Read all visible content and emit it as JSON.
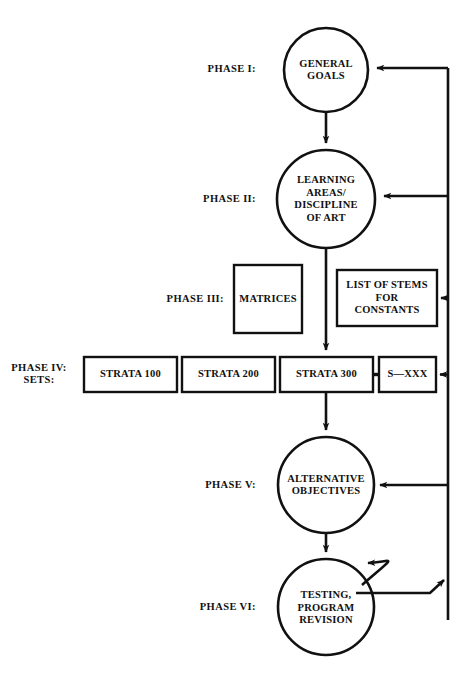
{
  "diagram": {
    "ink_color": "#111111",
    "background_color": "#ffffff",
    "phases": [
      {
        "id": "phase-1",
        "label": "PHASE I:",
        "shape": "circle",
        "text_lines": [
          "GENERAL",
          "GOALS"
        ]
      },
      {
        "id": "phase-2",
        "label": "PHASE II:",
        "shape": "circle",
        "text_lines": [
          "LEARNING",
          "AREAS/",
          "DISCIPLINE",
          "OF ART"
        ]
      },
      {
        "id": "phase-3",
        "label": "PHASE III:",
        "shape": "rectangle",
        "text_lines": [
          "MATRICES"
        ]
      },
      {
        "id": "phase-4",
        "label": "PHASE IV:\nSETS:",
        "shape": "rectangle-row",
        "text_lines": []
      },
      {
        "id": "phase-5",
        "label": "PHASE V:",
        "shape": "circle",
        "text_lines": [
          "ALTERNATIVE",
          "OBJECTIVES"
        ]
      },
      {
        "id": "phase-6",
        "label": "PHASE VI:",
        "shape": "circle",
        "text_lines": [
          "TESTING,",
          "PROGRAM",
          "REVISION"
        ]
      }
    ],
    "nodes": {
      "general_goals": {
        "lines": [
          "GENERAL",
          "GOALS"
        ]
      },
      "learning_areas": {
        "lines": [
          "LEARNING",
          "AREAS/",
          "DISCIPLINE",
          "OF ART"
        ]
      },
      "matrices": {
        "lines": [
          "MATRICES"
        ]
      },
      "list_of_stems": {
        "lines": [
          "LIST OF STEMS",
          "FOR",
          "CONSTANTS"
        ]
      },
      "strata_100": {
        "lines": [
          "STRATA 100"
        ]
      },
      "strata_200": {
        "lines": [
          "STRATA 200"
        ]
      },
      "strata_300": {
        "lines": [
          "STRATA 300"
        ]
      },
      "s_xxx": {
        "lines": [
          "S—XXX"
        ]
      },
      "alternative_objectives": {
        "lines": [
          "ALTERNATIVE",
          "OBJECTIVES"
        ]
      },
      "testing_program_revision": {
        "lines": [
          "TESTING,",
          "PROGRAM",
          "REVISION"
        ]
      }
    },
    "phase_labels": {
      "phase_1": "PHASE I:",
      "phase_2": "PHASE II:",
      "phase_3": "PHASE III:",
      "phase_4": "PHASE IV:\nSETS:",
      "phase_5": "PHASE V:",
      "phase_6": "PHASE VI:"
    },
    "connections": [
      {
        "from": "general_goals",
        "to": "learning_areas",
        "type": "arrow-down"
      },
      {
        "from": "learning_areas",
        "to": "strata_300",
        "type": "arrow-down"
      },
      {
        "from": "strata_300",
        "to": "s_xxx",
        "type": "short-link"
      },
      {
        "from": "strata_300",
        "to": "alternative_objectives",
        "type": "arrow-down"
      },
      {
        "from": "alternative_objectives",
        "to": "testing_program_revision",
        "type": "arrow-down"
      },
      {
        "from": "testing_program_revision",
        "to": "testing_program_revision",
        "type": "self-loop"
      },
      {
        "from": "testing_program_revision",
        "to": "feedback-bus",
        "type": "arrow-right"
      },
      {
        "from": "feedback-bus",
        "to": "general_goals",
        "type": "arrow-left"
      },
      {
        "from": "feedback-bus",
        "to": "learning_areas",
        "type": "arrow-left"
      },
      {
        "from": "feedback-bus",
        "to": "list_of_stems",
        "type": "arrow-left"
      },
      {
        "from": "feedback-bus",
        "to": "s_xxx",
        "type": "arrow-left"
      },
      {
        "from": "feedback-bus",
        "to": "alternative_objectives",
        "type": "arrow-left"
      }
    ]
  }
}
